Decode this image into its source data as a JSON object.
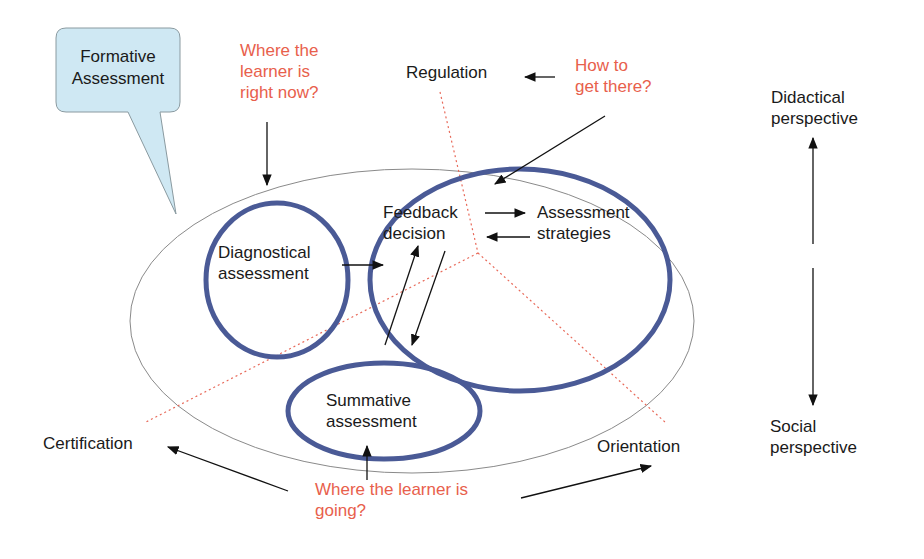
{
  "diagram": {
    "callout": {
      "line1": "Formative",
      "line2": "Assessment"
    },
    "questions": {
      "now": {
        "line1": "Where the",
        "line2": "learner is",
        "line3": "right now?"
      },
      "how": {
        "line1": "How to",
        "line2": "get there?"
      },
      "going": {
        "line1": "Where the learner is",
        "line2": "going?"
      }
    },
    "nodes": {
      "diagnostical": {
        "line1": "Diagnostical",
        "line2": "assessment"
      },
      "feedback": {
        "line1": "Feedback",
        "line2": "decision"
      },
      "strategies": {
        "line1": "Assessment",
        "line2": "strategies"
      },
      "summative": {
        "line1": "Summative",
        "line2": "assessment"
      }
    },
    "functions": {
      "regulation": "Regulation",
      "certification": "Certification",
      "orientation": "Orientation"
    },
    "perspectives": {
      "top": {
        "line1": "Didactical",
        "line2": "perspective"
      },
      "bottom": {
        "line1": "Social",
        "line2": "perspective"
      }
    },
    "colors": {
      "node_outline": "#4a5a96",
      "question_text": "#e8604c",
      "divider": "#e86a5a",
      "callout_fill": "#cfe8f3",
      "outer_ellipse": "#8a8a8a"
    }
  }
}
